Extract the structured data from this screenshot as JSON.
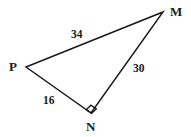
{
  "figure": {
    "kind": "geometry-diagram",
    "shape": "right-triangle",
    "background_color": "#ffffff",
    "stroke_color": "#1a1a1a",
    "stroke_width": 1.5,
    "vertices": [
      {
        "name": "M",
        "label": "M",
        "x": 163,
        "y": 12,
        "label_x": 170,
        "label_y": 5
      },
      {
        "name": "P",
        "label": "P",
        "x": 26,
        "y": 67,
        "label_x": 9,
        "label_y": 60
      },
      {
        "name": "N",
        "label": "N",
        "x": 91,
        "y": 113,
        "label_x": 86,
        "label_y": 120
      }
    ],
    "sides": [
      {
        "name": "PM",
        "from": "P",
        "to": "M",
        "length_label": "34",
        "label_x": 71,
        "label_y": 29
      },
      {
        "name": "MN",
        "from": "M",
        "to": "N",
        "length_label": "30",
        "label_x": 133,
        "label_y": 63
      },
      {
        "name": "PN",
        "from": "P",
        "to": "N",
        "length_label": "16",
        "label_x": 43,
        "label_y": 95
      }
    ],
    "right_angle": {
      "at_vertex": "N",
      "marker": "right-angle-square",
      "size": 8
    },
    "polyline_points": "26,67 163,12 91,113 26,67"
  }
}
